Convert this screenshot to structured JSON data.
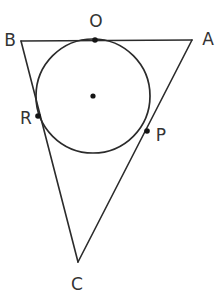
{
  "figure": {
    "stroke_color": "#2b2b2b",
    "label_color": "#333333",
    "dot_color": "#141414",
    "background": "#ffffff",
    "width": 218,
    "height": 300
  },
  "triangle": {
    "vertices": [
      {
        "id": "B",
        "label": "B",
        "x": 21,
        "y": 41,
        "label_x": 10,
        "label_y": 46
      },
      {
        "id": "A",
        "label": "A",
        "x": 192,
        "y": 40,
        "label_x": 208,
        "label_y": 45
      },
      {
        "id": "C",
        "label": "C",
        "x": 78,
        "y": 262,
        "label_x": 77,
        "label_y": 290
      }
    ],
    "edges": [
      {
        "id": "BA",
        "from": "B",
        "to": "A"
      },
      {
        "id": "BC",
        "from": "B",
        "to": "C"
      },
      {
        "id": "AC",
        "from": "A",
        "to": "C"
      }
    ]
  },
  "circle": {
    "center_x": 93,
    "center_y": 96,
    "radius": 57,
    "center_dot_radius": 2.6,
    "has_center_dot": true
  },
  "tangent_points": [
    {
      "id": "O",
      "label": "O",
      "x": 95,
      "y": 40,
      "dot_radius": 2.8,
      "label_x": 96,
      "label_y": 27,
      "on_edge": "BA"
    },
    {
      "id": "R",
      "label": "R",
      "x": 38,
      "y": 116,
      "dot_radius": 2.8,
      "label_x": 26,
      "label_y": 124,
      "on_edge": "BC"
    },
    {
      "id": "P",
      "label": "P",
      "x": 147,
      "y": 131,
      "dot_radius": 2.8,
      "label_x": 161,
      "label_y": 141,
      "on_edge": "AC"
    }
  ]
}
